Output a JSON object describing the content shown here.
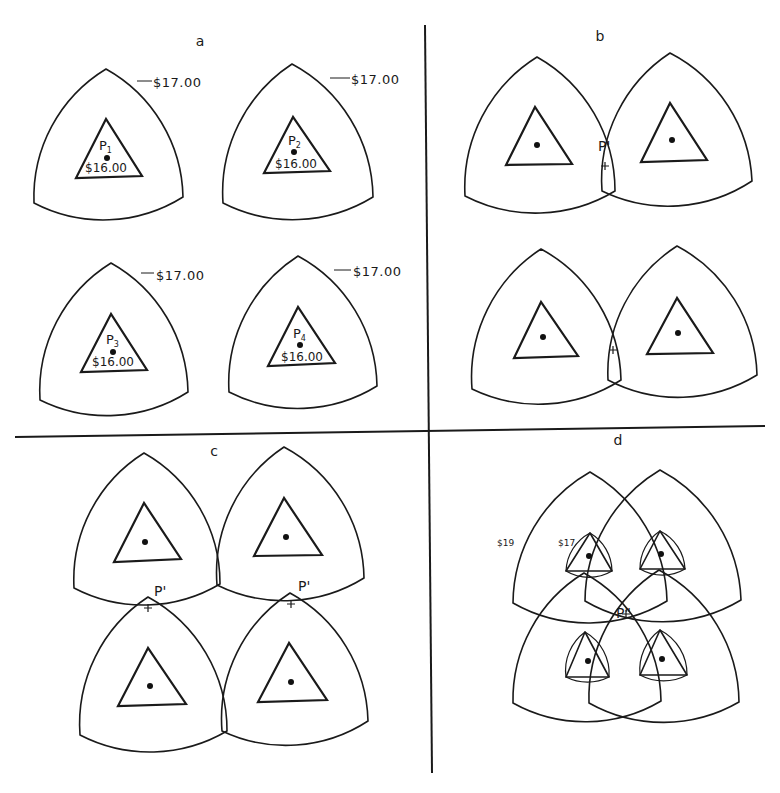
{
  "figure": {
    "width": 780,
    "height": 793,
    "colors": {
      "ink": "#1a1a1a",
      "paper": "#ffffff"
    },
    "dividers": [
      {
        "name": "vertical-divider",
        "x1": 425,
        "y1": 25,
        "x2": 432,
        "y2": 773
      },
      {
        "name": "horizontal-divider",
        "x1": 15,
        "y1": 437,
        "x2": 765,
        "y2": 426
      }
    ],
    "panels": [
      {
        "id": "a",
        "label": "a",
        "label_pos": [
          200,
          46
        ],
        "units": [
          {
            "name": "market-area-p1",
            "top": [
              106,
              69
            ],
            "left": [
              34,
              203
            ],
            "right": [
              183,
              197
            ],
            "tri": [
              [
                106,
                119
              ],
              [
                76,
                178
              ],
              [
                142,
                176
              ]
            ],
            "dot": [
              107,
              158
            ],
            "point_label": "P",
            "point_sub": "1",
            "point_label_pos": [
              99,
              150
            ],
            "center_price": "$16.00",
            "center_price_pos": [
              85,
              172
            ],
            "boundary_price": "$17.00",
            "boundary_price_pos": [
              153,
              87
            ],
            "leader": [
              [
                137,
                81
              ],
              [
                152,
                81
              ]
            ]
          },
          {
            "name": "market-area-p2",
            "top": [
              292,
              64
            ],
            "left": [
              223,
              203
            ],
            "right": [
              373,
              197
            ],
            "tri": [
              [
                293,
                117
              ],
              [
                264,
                173
              ],
              [
                330,
                171
              ]
            ],
            "dot": [
              294,
              152
            ],
            "point_label": "P",
            "point_sub": "2",
            "point_label_pos": [
              288,
              145
            ],
            "center_price": "$16.00",
            "center_price_pos": [
              275,
              168
            ],
            "boundary_price": "$17.00",
            "boundary_price_pos": [
              351,
              84
            ],
            "leader": [
              [
                330,
                78
              ],
              [
                350,
                78
              ]
            ]
          },
          {
            "name": "market-area-p3",
            "top": [
              111,
              263
            ],
            "left": [
              40,
              400
            ],
            "right": [
              188,
              392
            ],
            "tri": [
              [
                111,
                314
              ],
              [
                81,
                372
              ],
              [
                147,
                370
              ]
            ],
            "dot": [
              113,
              352
            ],
            "point_label": "P",
            "point_sub": "3",
            "point_label_pos": [
              106,
              344
            ],
            "center_price": "$16.00",
            "center_price_pos": [
              92,
              366
            ],
            "boundary_price": "$17.00",
            "boundary_price_pos": [
              156,
              280
            ],
            "leader": [
              [
                141,
                273
              ],
              [
                154,
                273
              ]
            ]
          },
          {
            "name": "market-area-p4",
            "top": [
              298,
              256
            ],
            "left": [
              229,
              392
            ],
            "right": [
              377,
              386
            ],
            "tri": [
              [
                298,
                307
              ],
              [
                268,
                366
              ],
              [
                335,
                363
              ]
            ],
            "dot": [
              300,
              345
            ],
            "point_label": "P",
            "point_sub": "4",
            "point_label_pos": [
              293,
              338
            ],
            "center_price": "$16.00",
            "center_price_pos": [
              281,
              361
            ],
            "boundary_price": "$17.00",
            "boundary_price_pos": [
              353,
              276
            ],
            "leader": [
              [
                334,
                270
              ],
              [
                351,
                270
              ]
            ]
          }
        ]
      },
      {
        "id": "b",
        "label": "b",
        "label_pos": [
          600,
          41
        ],
        "units": [
          {
            "name": "market-area-left-top",
            "top": [
              537,
              57
            ],
            "left": [
              465,
              196
            ],
            "right": [
              615,
              191
            ],
            "tri": [
              [
                535,
                107
              ],
              [
                506,
                165
              ],
              [
                572,
                164
              ]
            ],
            "dot": [
              537,
              145
            ]
          },
          {
            "name": "market-area-right-top",
            "top": [
              670,
              53
            ],
            "left": [
              602,
              191
            ],
            "right": [
              752,
              181
            ],
            "tri": [
              [
                670,
                103
              ],
              [
                641,
                162
              ],
              [
                707,
                160
              ]
            ],
            "dot": [
              672,
              140
            ]
          },
          {
            "name": "market-area-left-bottom",
            "top": [
              541,
              249
            ],
            "left": [
              472,
              389
            ],
            "right": [
              621,
              380
            ],
            "tri": [
              [
                541,
                302
              ],
              [
                514,
                358
              ],
              [
                578,
                356
              ]
            ],
            "dot": [
              543,
              337
            ]
          },
          {
            "name": "market-area-right-bottom",
            "top": [
              677,
              246
            ],
            "left": [
              608,
              380
            ],
            "right": [
              757,
              375
            ],
            "tri": [
              [
                677,
                298
              ],
              [
                647,
                354
              ],
              [
                713,
                353
              ]
            ],
            "dot": [
              678,
              333
            ]
          }
        ],
        "markers": [
          {
            "name": "p-prime-marker-top",
            "label": "P'",
            "label_pos": [
              598,
              151
            ],
            "plus_pos": [
              605,
              166
            ]
          },
          {
            "name": "plus-marker-bottom",
            "label": "",
            "label_pos": [
              0,
              0
            ],
            "plus_pos": [
              613,
              350
            ]
          }
        ]
      },
      {
        "id": "c",
        "label": "c",
        "label_pos": [
          214,
          456
        ],
        "units": [
          {
            "name": "market-area-top-left",
            "top": [
              144,
              453
            ],
            "left": [
              74,
              588
            ],
            "right": [
              220,
              584
            ],
            "tri": [
              [
                144,
                503
              ],
              [
                114,
                562
              ],
              [
                181,
                559
              ]
            ],
            "dot": [
              145,
              542
            ]
          },
          {
            "name": "market-area-top-right",
            "top": [
              284,
              447
            ],
            "left": [
              217,
              585
            ],
            "right": [
              364,
              578
            ],
            "tri": [
              [
                284,
                498
              ],
              [
                254,
                556
              ],
              [
                322,
                555
              ]
            ],
            "dot": [
              286,
              537
            ]
          },
          {
            "name": "market-area-bottom-left",
            "top": [
              148,
              597
            ],
            "left": [
              80,
              735
            ],
            "right": [
              227,
              731
            ],
            "tri": [
              [
                148,
                648
              ],
              [
                118,
                706
              ],
              [
                186,
                704
              ]
            ],
            "dot": [
              150,
              686
            ]
          },
          {
            "name": "market-area-bottom-right",
            "top": [
              290,
              593
            ],
            "left": [
              222,
              731
            ],
            "right": [
              368,
              721
            ],
            "tri": [
              [
                289,
                643
              ],
              [
                258,
                702
              ],
              [
                327,
                700
              ]
            ],
            "dot": [
              291,
              682
            ]
          }
        ],
        "markers": [
          {
            "name": "p-prime-marker-left",
            "label": "P'",
            "label_pos": [
              154,
              596
            ],
            "plus_pos": [
              148,
              608
            ]
          },
          {
            "name": "p-prime-marker-right",
            "label": "P'",
            "label_pos": [
              298,
              591
            ],
            "plus_pos": [
              291,
              604
            ]
          }
        ]
      },
      {
        "id": "d",
        "label": "d",
        "label_pos": [
          618,
          445
        ],
        "big_units": [
          {
            "name": "outer-area-top-left",
            "top": [
              590,
              472
            ],
            "left": [
              513,
              603
            ],
            "right": [
              667,
              601
            ]
          },
          {
            "name": "outer-area-top-right",
            "top": [
              660,
              470
            ],
            "left": [
              585,
              601
            ],
            "right": [
              741,
              600
            ]
          },
          {
            "name": "outer-area-bottom-left",
            "top": [
              584,
              573
            ],
            "left": [
              513,
              703
            ],
            "right": [
              661,
              701
            ]
          },
          {
            "name": "outer-area-bottom-right",
            "top": [
              659,
              570
            ],
            "left": [
              589,
              703
            ],
            "right": [
              739,
              702
            ]
          }
        ],
        "small_units": [
          {
            "name": "inner-area-top-left",
            "top": [
              590,
              533
            ],
            "left": [
              566,
              571
            ],
            "right": [
              612,
              571
            ],
            "dot": [
              589,
              556
            ]
          },
          {
            "name": "inner-area-top-right",
            "top": [
              660,
              531
            ],
            "left": [
              640,
              569
            ],
            "right": [
              685,
              569
            ],
            "dot": [
              661,
              554
            ]
          },
          {
            "name": "inner-area-bottom-left",
            "top": [
              585,
              632
            ],
            "left": [
              566,
              677
            ],
            "right": [
              609,
              677
            ],
            "dot": [
              588,
              661
            ]
          },
          {
            "name": "inner-area-bottom-right",
            "top": [
              660,
              630
            ],
            "left": [
              640,
              675
            ],
            "right": [
              687,
              675
            ],
            "dot": [
              662,
              659
            ]
          }
        ],
        "price_labels": [
          {
            "name": "price-label-19",
            "text": "$19",
            "pos": [
              497,
              546
            ]
          },
          {
            "name": "price-label-17",
            "text": "$17",
            "pos": [
              558,
              546
            ]
          }
        ],
        "markers": [
          {
            "name": "p-double-prime-marker",
            "label": "P\"",
            "label_pos": [
              616,
              618
            ],
            "plus_pos": [
              626,
              614
            ]
          }
        ]
      }
    ],
    "caption": ""
  }
}
